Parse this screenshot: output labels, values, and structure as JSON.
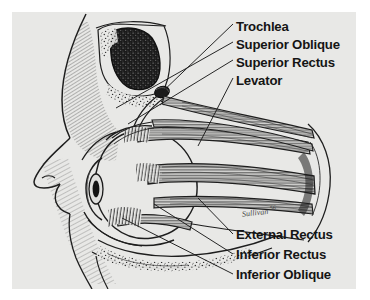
{
  "figure": {
    "medium": "pen-and-ink anatomical illustration",
    "view": "sagittal / lateral section of the human orbit",
    "panel_background_color": "#e8e8e6",
    "page_background_color": "#ffffff",
    "ink_color": "#1e1e1e",
    "label_color": "#151515"
  },
  "signature": {
    "text": "Sullivan",
    "suffix": "56"
  },
  "labels": {
    "top": [
      {
        "id": "trochlea",
        "text": "Trochlea",
        "x": 236,
        "y": 20
      },
      {
        "id": "superior-oblique",
        "text": "Superior Oblique",
        "x": 236,
        "y": 38
      },
      {
        "id": "superior-rectus",
        "text": "Superior Rectus",
        "x": 236,
        "y": 56
      },
      {
        "id": "levator",
        "text": "Levator",
        "x": 236,
        "y": 74
      }
    ],
    "bottom": [
      {
        "id": "external-rectus",
        "text": "External Rectus",
        "x": 236,
        "y": 232
      },
      {
        "id": "inferior-rectus",
        "text": "Inferior Rectus",
        "x": 236,
        "y": 252
      },
      {
        "id": "inferior-oblique",
        "text": "Inferior Oblique",
        "x": 236,
        "y": 272
      }
    ]
  },
  "leader_lines": {
    "top": [
      {
        "id": "leader-trochlea",
        "from": [
          233,
          24
        ],
        "to": [
          146,
          96
        ]
      },
      {
        "id": "leader-superior-oblique",
        "from": [
          233,
          42
        ],
        "to": [
          118,
          104
        ]
      },
      {
        "id": "leader-superior-rectus",
        "from": [
          233,
          60
        ],
        "to": [
          128,
          122
        ]
      },
      {
        "id": "leader-levator",
        "from": [
          233,
          78
        ],
        "to": [
          196,
          148
        ]
      }
    ],
    "bottom": [
      {
        "id": "leader-external-rectus",
        "from": [
          233,
          228
        ],
        "to": [
          196,
          196
        ]
      },
      {
        "id": "leader-inferior-rectus",
        "from": [
          233,
          248
        ],
        "to": [
          150,
          200
        ]
      },
      {
        "id": "leader-inferior-oblique",
        "from": [
          233,
          268
        ],
        "to": [
          118,
          212
        ]
      }
    ]
  },
  "anatomy": {
    "structures": [
      "face profile",
      "forehead",
      "nose",
      "upper lip",
      "cheek",
      "frontal sinus",
      "orbital roof bone",
      "trochlea",
      "eyeball",
      "cornea",
      "iris",
      "upper eyelid",
      "lower eyelid",
      "superior oblique muscle",
      "superior rectus muscle",
      "levator palpebrae muscle",
      "external (lateral) rectus muscle",
      "inferior rectus muscle",
      "inferior oblique muscle",
      "orbital apex",
      "maxillary sinus",
      "orbital floor bone"
    ]
  }
}
